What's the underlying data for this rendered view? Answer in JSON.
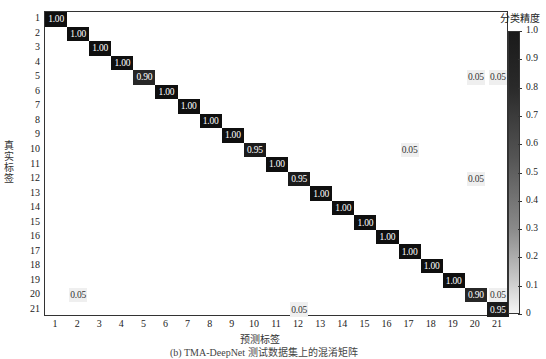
{
  "chart_data": {
    "type": "heatmap",
    "title": "",
    "xlabel": "预测标签",
    "ylabel": "真实标签",
    "colorbar_label": "分类精度",
    "colorbar_ticks": [
      "1.0",
      "0.9",
      "0.8",
      "0.7",
      "0.6",
      "0.5",
      "0.4",
      "0.3",
      "0.2",
      "0.1",
      "0"
    ],
    "vmin": 0,
    "vmax": 1,
    "x_categories": [
      "1",
      "2",
      "3",
      "4",
      "5",
      "6",
      "7",
      "8",
      "9",
      "10",
      "11",
      "12",
      "13",
      "14",
      "15",
      "16",
      "17",
      "18",
      "19",
      "20",
      "21"
    ],
    "y_categories": [
      "1",
      "2",
      "3",
      "4",
      "5",
      "6",
      "7",
      "8",
      "9",
      "10",
      "11",
      "12",
      "13",
      "14",
      "15",
      "16",
      "17",
      "18",
      "19",
      "20",
      "21"
    ],
    "cells": [
      {
        "row": 1,
        "col": 1,
        "value": "1.00"
      },
      {
        "row": 2,
        "col": 2,
        "value": "1.00"
      },
      {
        "row": 3,
        "col": 3,
        "value": "1.00"
      },
      {
        "row": 4,
        "col": 4,
        "value": "1.00"
      },
      {
        "row": 5,
        "col": 5,
        "value": "0.90"
      },
      {
        "row": 5,
        "col": 20,
        "value": "0.05"
      },
      {
        "row": 5,
        "col": 21,
        "value": "0.05"
      },
      {
        "row": 6,
        "col": 6,
        "value": "1.00"
      },
      {
        "row": 7,
        "col": 7,
        "value": "1.00"
      },
      {
        "row": 8,
        "col": 8,
        "value": "1.00"
      },
      {
        "row": 9,
        "col": 9,
        "value": "1.00"
      },
      {
        "row": 10,
        "col": 10,
        "value": "0.95"
      },
      {
        "row": 10,
        "col": 17,
        "value": "0.05"
      },
      {
        "row": 11,
        "col": 11,
        "value": "1.00"
      },
      {
        "row": 12,
        "col": 12,
        "value": "0.95"
      },
      {
        "row": 12,
        "col": 20,
        "value": "0.05"
      },
      {
        "row": 13,
        "col": 13,
        "value": "1.00"
      },
      {
        "row": 14,
        "col": 14,
        "value": "1.00"
      },
      {
        "row": 15,
        "col": 15,
        "value": "1.00"
      },
      {
        "row": 16,
        "col": 16,
        "value": "1.00"
      },
      {
        "row": 17,
        "col": 17,
        "value": "1.00"
      },
      {
        "row": 18,
        "col": 18,
        "value": "1.00"
      },
      {
        "row": 19,
        "col": 19,
        "value": "1.00"
      },
      {
        "row": 20,
        "col": 2,
        "value": "0.05"
      },
      {
        "row": 20,
        "col": 20,
        "value": "0.90"
      },
      {
        "row": 20,
        "col": 21,
        "value": "0.05"
      },
      {
        "row": 21,
        "col": 12,
        "value": "0.05"
      },
      {
        "row": 21,
        "col": 21,
        "value": "0.95"
      }
    ],
    "caption": "(b) TMA-DeepNet 测试数据集上的混淆矩阵"
  }
}
